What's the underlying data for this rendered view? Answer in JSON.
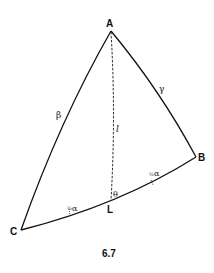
{
  "figure": {
    "caption": "6.7",
    "vertices": {
      "A": "A",
      "B": "B",
      "C": "C",
      "L": "L"
    },
    "side_labels": {
      "AC": "β",
      "AB": "γ",
      "AL": "l"
    },
    "angle_label": "θ",
    "half_alpha_labels": [
      {
        "frac": "½",
        "symbol": "α"
      },
      {
        "frac": "½",
        "symbol": "α"
      }
    ],
    "line_color": "#111111"
  }
}
